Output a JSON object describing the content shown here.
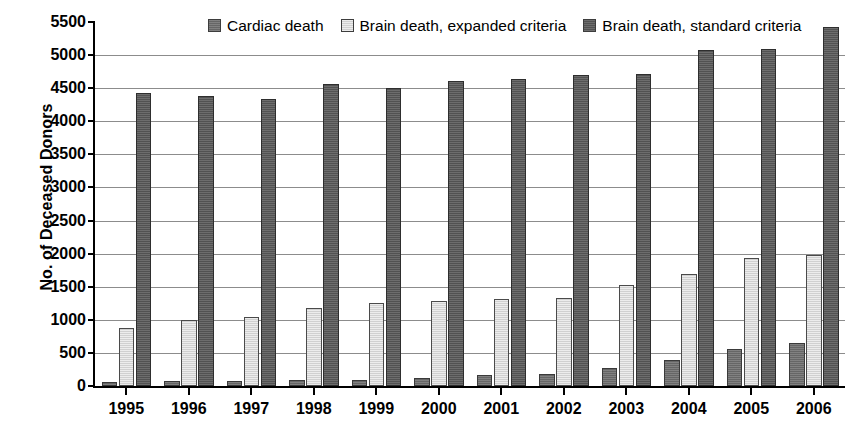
{
  "chart_data": {
    "type": "bar",
    "title": "",
    "subtitle": "",
    "xlabel": "",
    "ylabel": "No. of Deceased Donors",
    "categories": [
      "1995",
      "1996",
      "1997",
      "1998",
      "1999",
      "2000",
      "2001",
      "2002",
      "2003",
      "2004",
      "2005",
      "2006"
    ],
    "series": [
      {
        "name": "Cardiac death",
        "color": "#6e6e6e",
        "values": [
          64,
          71,
          78,
          85,
          88,
          118,
          168,
          189,
          266,
          391,
          563,
          645
        ]
      },
      {
        "name": "Brain death, expanded criteria",
        "color": "#dddddd",
        "values": [
          870,
          990,
          1050,
          1180,
          1255,
          1290,
          1310,
          1330,
          1520,
          1695,
          1935,
          1985
        ]
      },
      {
        "name": "Brain death, standard criteria",
        "color": "#5b5b5b",
        "values": [
          4430,
          4375,
          4330,
          4570,
          4510,
          4615,
          4635,
          4700,
          4720,
          5080,
          5095,
          5430
        ]
      }
    ],
    "ylim": [
      0,
      5500
    ],
    "ytick_step": 500,
    "yticks": [
      0,
      500,
      1000,
      1500,
      2000,
      2500,
      3000,
      3500,
      4000,
      4500,
      5000,
      5500
    ],
    "ytick_labels": [
      "0",
      "500",
      "1000",
      "1500",
      "2000",
      "2500",
      "3000",
      "3500",
      "4000",
      "4500",
      "5000",
      "5500"
    ],
    "grid": true,
    "grid_axis": "y",
    "legend_position": "top-center",
    "annotations": []
  }
}
